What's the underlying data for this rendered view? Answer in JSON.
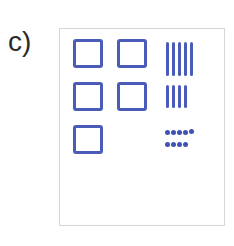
{
  "figure": {
    "label": "c)",
    "ink_color": "#4a5cb8",
    "groups": {
      "squares": {
        "count": 5,
        "layout": "2 + 2 + 1"
      },
      "tally_lines": {
        "rows": [
          5,
          4
        ]
      },
      "dots": {
        "rows": [
          5,
          4
        ]
      }
    }
  }
}
